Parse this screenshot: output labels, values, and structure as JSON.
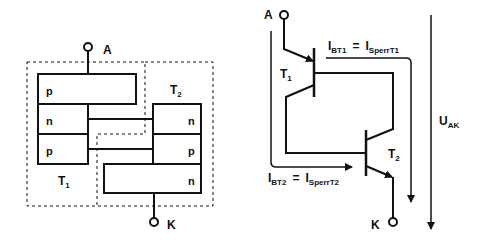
{
  "left_diagram": {
    "anode_label": "A",
    "cathode_label": "K",
    "t1_label": "T",
    "t1_sub": "1",
    "t2_label": "T",
    "t2_sub": "2",
    "layers_left": [
      "p",
      "n",
      "p"
    ],
    "layers_right": [
      "n",
      "p",
      "n"
    ]
  },
  "right_diagram": {
    "anode_label": "A",
    "cathode_label": "K",
    "t1_label": "T",
    "t1_sub": "1",
    "t2_label": "T",
    "t2_sub": "2",
    "current1": {
      "lhs": "I",
      "lhs_sub": "BT1",
      "eq": "=",
      "rhs": "I",
      "rhs_sub": "SperrT1"
    },
    "current2": {
      "lhs": "I",
      "lhs_sub": "BT2",
      "eq": "=",
      "rhs": "I",
      "rhs_sub": "SperrT2"
    },
    "voltage": {
      "label": "U",
      "sub": "AK"
    }
  },
  "colors": {
    "line": "#111111",
    "background": "#ffffff"
  }
}
